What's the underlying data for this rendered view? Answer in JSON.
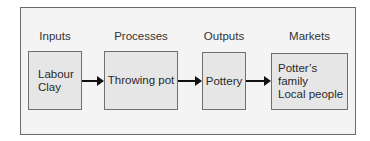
{
  "diagram": {
    "type": "flow",
    "columns": [
      {
        "heading": "Inputs",
        "lines": [
          "Labour",
          "Clay"
        ]
      },
      {
        "heading": "Processes",
        "lines": [
          "Throwing pot"
        ]
      },
      {
        "heading": "Outputs",
        "lines": [
          "Pottery"
        ]
      },
      {
        "heading": "Markets",
        "lines": [
          "Potter’s family",
          "Local people"
        ]
      }
    ],
    "edges": [
      {
        "from": "Labour / Clay",
        "to": "Throwing pot"
      },
      {
        "from": "Throwing pot",
        "to": "Pottery"
      },
      {
        "from": "Pottery",
        "to": "Potter’s family / Local people"
      }
    ]
  }
}
